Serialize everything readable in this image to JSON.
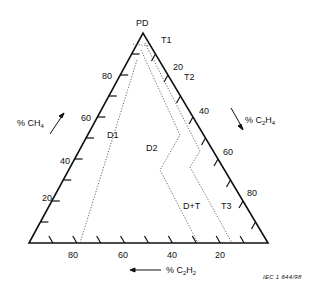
{
  "diagram": {
    "type": "duval-triangle",
    "vertex_label": "PD",
    "axes": {
      "left": {
        "label": "% CH4",
        "label_main": "% CH",
        "label_sub": "4",
        "ticks": [
          "20",
          "40",
          "60",
          "80"
        ]
      },
      "right": {
        "label": "% C2H4",
        "label_main": "% C",
        "label_sub1": "2",
        "label_mid": "H",
        "label_sub2": "4",
        "ticks": [
          "20",
          "40",
          "60",
          "80"
        ]
      },
      "bottom": {
        "label": "% C2H2",
        "label_main": "% C",
        "label_sub1": "2",
        "label_mid": "H",
        "label_sub2": "2",
        "ticks": [
          "80",
          "60",
          "40",
          "20"
        ]
      }
    },
    "zones": [
      "T1",
      "T2",
      "D1",
      "D2",
      "D+T",
      "T3"
    ],
    "reference": "IEC  1 644/98"
  },
  "colors": {
    "line": "#111111",
    "background": "#ffffff"
  }
}
